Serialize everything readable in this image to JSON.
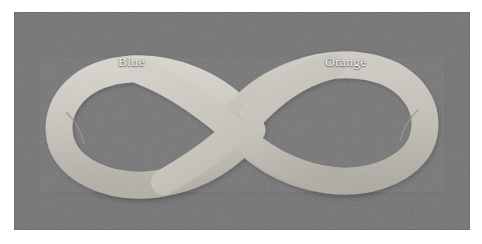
{
  "figure": {
    "kind": "photograph",
    "background_color": "#757575",
    "band_color": "#c8c5be",
    "plate": {
      "x": 14,
      "y": 12,
      "width": 456,
      "height": 218
    },
    "page_color": "#ffffff"
  },
  "labels": {
    "left": {
      "text": "Blue",
      "color": "#f2f0ec",
      "x": 118,
      "y": 50
    },
    "right": {
      "text": "Orange",
      "color": "#f2f0ec",
      "x": 325,
      "y": 50
    }
  },
  "icons": {
    "seam_left": "seam-joint-icon",
    "seam_right": "seam-joint-icon",
    "crossing": "band-crossing-icon"
  }
}
